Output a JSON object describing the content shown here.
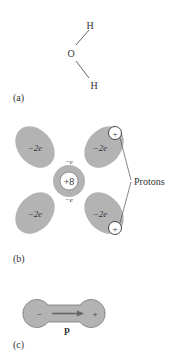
{
  "panel_a": {
    "label": "(a)",
    "atoms": {
      "top": "H",
      "center": "O",
      "bottom": "H"
    }
  },
  "panel_b": {
    "label": "(b)",
    "lobe_charge": "−2e",
    "nucleus_charge": "+8",
    "inner_electron": "−e",
    "proton_symbol": "+",
    "protons_label": "Protons"
  },
  "panel_c": {
    "label": "(c)",
    "minus": "−",
    "plus": "+",
    "dipole_label": "p"
  },
  "colors": {
    "lobe_fill": "#b3b3b3",
    "line": "#555555",
    "text": "#333333"
  }
}
